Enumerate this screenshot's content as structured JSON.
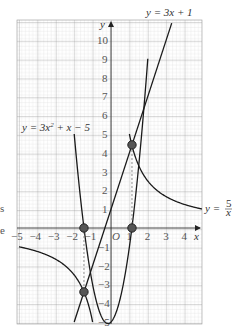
{
  "chart_data": {
    "type": "line",
    "title": "",
    "xlabel": "x",
    "ylabel": "y",
    "xlim": [
      -5,
      5
    ],
    "ylim": [
      -5,
      10.9
    ],
    "grid": true,
    "x_ticks": [
      "−5",
      "−4",
      "−3",
      "−2",
      "−1",
      "O",
      "1",
      "2",
      "3",
      "4"
    ],
    "y_ticks_pos": [
      "1",
      "2",
      "3",
      "4",
      "5",
      "6",
      "7",
      "8",
      "9",
      "10"
    ],
    "y_ticks_neg": [
      "−1",
      "−2",
      "−3",
      "−4",
      "−5"
    ],
    "series": [
      {
        "name": "y = 3x + 1",
        "equation": "3x+1",
        "x": [
          -2,
          3.3
        ],
        "y": [
          -5,
          10.9
        ]
      },
      {
        "name": "y = 3x² + x − 5",
        "equation": "3x^2+x-5",
        "x_range": [
          -2.0,
          2.0
        ],
        "y_at_ends": [
          5,
          9
        ],
        "vertex": [
          -0.17,
          -5.08
        ]
      },
      {
        "name": "y = 5/x",
        "equation": "5/x",
        "branches": [
          {
            "x_range": [
              1.0,
              5.0
            ]
          },
          {
            "x_range": [
              -5.0,
              -1.0
            ]
          }
        ]
      }
    ],
    "points": [
      {
        "x": -1.47,
        "y": 0,
        "label": "root"
      },
      {
        "x": 1.14,
        "y": 0,
        "label": "root"
      },
      {
        "x": 1.14,
        "y": 4.42,
        "label": "intersection"
      },
      {
        "x": -1.47,
        "y": -3.4,
        "label": "intersection"
      }
    ],
    "dashed_guides": [
      {
        "x": -1.47,
        "from_y": 0,
        "to_y": -3.4
      },
      {
        "x": 1.14,
        "from_y": 0,
        "to_y": 4.42
      }
    ],
    "annotations": {
      "line_label": "y = 3x + 1",
      "parabola_label_main": "y = 3x",
      "parabola_label_sup": "2",
      "parabola_label_rest": " + x − 5",
      "hyperbola_label_prefix": "y = ",
      "hyperbola_label_num": "5",
      "hyperbola_label_den": "x",
      "x_axis_label": "x",
      "y_axis_label": "y",
      "origin_label": "O"
    },
    "cropped_fragments": [
      "s",
      "e"
    ]
  }
}
